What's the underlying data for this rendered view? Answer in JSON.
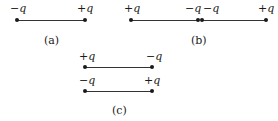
{
  "figure": {
    "a": {
      "caption": "(a)",
      "left_charge": "−q",
      "right_charge": "+q"
    },
    "b": {
      "caption": "(b)",
      "charges": [
        "+q",
        "−q",
        "−q",
        "+q"
      ]
    },
    "c": {
      "caption": "(c)",
      "top": {
        "left_charge": "+q",
        "right_charge": "−q"
      },
      "bottom": {
        "left_charge": "−q",
        "right_charge": "+q"
      }
    },
    "colors": {
      "ink": "#1a1a1a",
      "line": "#333333",
      "background": "#ffffff"
    }
  }
}
